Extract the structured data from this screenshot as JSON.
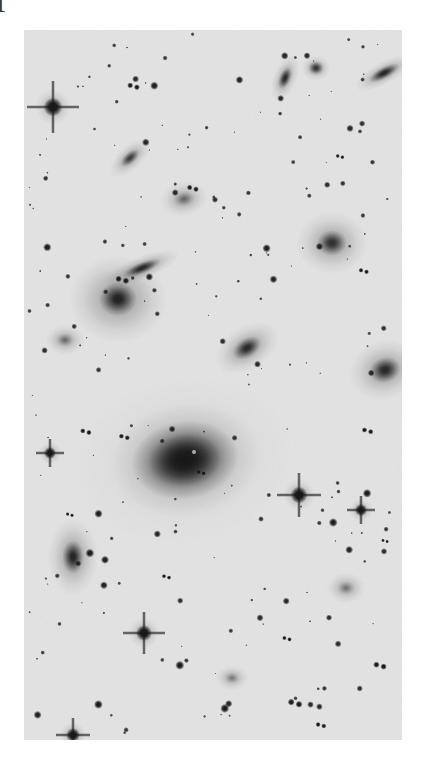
{
  "figure": {
    "label": "f",
    "caption_visible": false,
    "background_color": "#ffffff",
    "plate": {
      "x": 24,
      "y": 30,
      "width": 378,
      "height": 710,
      "sky_color": "#e3e3e3",
      "ink_color": "#111111",
      "polarity": "negative-greyscale",
      "description": "Deep optical negative image of a galaxy cluster field: numerous point-like stars, several bright stars with cross-shaped diffraction spikes, and many extended elliptical and edge-on spiral galaxies centered on one dominant cD elliptical galaxy."
    }
  },
  "sky": {
    "noise_opacity": 0.5,
    "vignette": "none"
  },
  "objects": {
    "dominant_galaxy": {
      "name": "central-cd-galaxy",
      "cx": 161,
      "cy": 430,
      "rx": 36,
      "ry": 26,
      "angle": -8,
      "peak_darkness": 0.97,
      "halo_rx": 74,
      "halo_ry": 56,
      "halo_darkness": 0.3
    },
    "galaxies": [
      {
        "name": "elliptical-galaxy-left-bright",
        "cx": 94,
        "cy": 269,
        "rx": 19,
        "ry": 17,
        "angle": 0,
        "darkness": 0.93,
        "halo": 2.6,
        "type": "elliptical"
      },
      {
        "name": "edge-on-galaxy-upper-left",
        "cx": 118,
        "cy": 238,
        "rx": 20,
        "ry": 6,
        "angle": -22,
        "darkness": 0.88,
        "halo": 2.0,
        "type": "edge-on-spiral"
      },
      {
        "name": "inclined-galaxy-upper-left-small",
        "cx": 106,
        "cy": 128,
        "rx": 12,
        "ry": 6,
        "angle": -42,
        "darkness": 0.7,
        "halo": 2.1,
        "type": "inclined-spiral"
      },
      {
        "name": "elongated-galaxy-top-centre",
        "cx": 261,
        "cy": 48,
        "rx": 12,
        "ry": 6,
        "angle": -68,
        "darkness": 0.86,
        "halo": 2.0,
        "type": "inclined-spiral"
      },
      {
        "name": "edge-on-galaxy-top-right",
        "cx": 360,
        "cy": 43,
        "rx": 17,
        "ry": 6,
        "angle": -28,
        "darkness": 0.9,
        "halo": 1.9,
        "type": "edge-on-spiral"
      },
      {
        "name": "elliptical-galaxy-upper-right",
        "cx": 308,
        "cy": 213,
        "rx": 15,
        "ry": 13,
        "angle": 0,
        "darkness": 0.82,
        "halo": 2.4,
        "type": "elliptical"
      },
      {
        "name": "lenticular-galaxy-mid-centre",
        "cx": 223,
        "cy": 318,
        "rx": 16,
        "ry": 10,
        "angle": -32,
        "darkness": 0.85,
        "halo": 2.2,
        "type": "lenticular"
      },
      {
        "name": "elliptical-galaxy-right-edge",
        "cx": 361,
        "cy": 340,
        "rx": 16,
        "ry": 13,
        "angle": -18,
        "darkness": 0.88,
        "halo": 2.3,
        "type": "elliptical"
      },
      {
        "name": "elliptical-galaxy-lower-left",
        "cx": 49,
        "cy": 527,
        "rx": 11,
        "ry": 17,
        "angle": 0,
        "darkness": 0.91,
        "halo": 2.3,
        "type": "elliptical"
      },
      {
        "name": "diffuse-galaxy-mid-left",
        "cx": 41,
        "cy": 310,
        "rx": 9,
        "ry": 7,
        "angle": 0,
        "darkness": 0.55,
        "halo": 2.2,
        "type": "diffuse-elliptical"
      },
      {
        "name": "diffuse-galaxy-upper-centre",
        "cx": 160,
        "cy": 169,
        "rx": 11,
        "ry": 8,
        "angle": -10,
        "darkness": 0.58,
        "halo": 2.2,
        "type": "diffuse-elliptical"
      },
      {
        "name": "diffuse-galaxy-lower-right",
        "cx": 322,
        "cy": 558,
        "rx": 9,
        "ry": 7,
        "angle": 0,
        "darkness": 0.48,
        "halo": 2.2,
        "type": "diffuse-elliptical"
      },
      {
        "name": "diffuse-galaxy-bottom-centre",
        "cx": 208,
        "cy": 648,
        "rx": 8,
        "ry": 6,
        "angle": 0,
        "darkness": 0.42,
        "halo": 2.1,
        "type": "diffuse-elliptical"
      },
      {
        "name": "compact-galaxy-pair-top-right",
        "cx": 292,
        "cy": 38,
        "rx": 8,
        "ry": 7,
        "angle": 0,
        "darkness": 0.78,
        "halo": 1.8,
        "type": "compact"
      }
    ],
    "bright_stars": [
      {
        "name": "bright-star-upper-left",
        "cx": 29,
        "cy": 77,
        "r": 9.5,
        "spike": 26
      },
      {
        "name": "bright-star-mid-right",
        "cx": 275,
        "cy": 465,
        "r": 8.5,
        "spike": 22
      },
      {
        "name": "bright-star-lower-centre",
        "cx": 120,
        "cy": 603,
        "r": 8.0,
        "spike": 21
      },
      {
        "name": "bright-star-bottom-left",
        "cx": 49,
        "cy": 705,
        "r": 7.0,
        "spike": 17
      },
      {
        "name": "bright-star-mid-left",
        "cx": 26,
        "cy": 423,
        "r": 6.0,
        "spike": 14
      },
      {
        "name": "bright-star-right-lower",
        "cx": 337,
        "cy": 480,
        "r": 6.2,
        "spike": 14
      }
    ],
    "star_count_approx": 210
  }
}
